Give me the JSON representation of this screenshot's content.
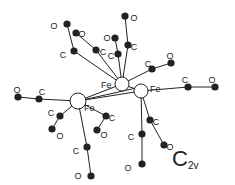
{
  "diagram": {
    "symmetry": {
      "main": "C",
      "subscript": "2v"
    },
    "colors": {
      "bond": "#222222",
      "atom_fill": "#222222",
      "fe_fill": "#ffffff",
      "background": "#ffffff"
    },
    "fe_atoms": [
      {
        "id": "fe1",
        "label": "Fe",
        "x": 78,
        "y": 101,
        "r": 8,
        "lx": 84,
        "ly": 108
      },
      {
        "id": "fe2",
        "label": "Fe",
        "x": 122,
        "y": 84,
        "r": 7,
        "lx": 101,
        "ly": 85
      },
      {
        "id": "fe3",
        "label": "Fe",
        "x": 141,
        "y": 91,
        "r": 7,
        "lx": 150,
        "ly": 89
      }
    ],
    "ligands": [
      {
        "fe": "fe2",
        "c": [
          74,
          51
        ],
        "o": [
          67,
          24
        ],
        "cl": [
          63,
          55
        ],
        "ol": [
          54,
          26
        ]
      },
      {
        "fe": "fe2",
        "c": [
          96,
          50
        ],
        "o": [
          76,
          33
        ],
        "cl": [
          103,
          52
        ],
        "ol": [
          82,
          34
        ]
      },
      {
        "fe": "fe2",
        "c": [
          128,
          45
        ],
        "o": [
          125,
          16
        ],
        "cl": [
          134,
          47
        ],
        "ol": [
          134,
          18
        ]
      },
      {
        "fe": "fe2",
        "c": [
          152,
          69
        ],
        "o": [
          171,
          63
        ],
        "cl": [
          148,
          64
        ],
        "ol": [
          170,
          56
        ]
      },
      {
        "fe": "fe3",
        "c": [
          188,
          87
        ],
        "o": [
          215,
          87
        ],
        "cl": [
          185,
          80
        ],
        "ol": [
          212,
          80
        ]
      },
      {
        "fe": "fe3",
        "c": [
          150,
          120
        ],
        "o": [
          164,
          145
        ],
        "cl": [
          156,
          122
        ],
        "ol": [
          170,
          147
        ]
      },
      {
        "fe": "fe3",
        "c": [
          142,
          134
        ],
        "o": [
          142,
          164
        ],
        "cl": [
          131,
          137
        ],
        "ol": [
          128,
          168
        ]
      },
      {
        "fe": "fe1",
        "c": [
          39,
          99
        ],
        "o": [
          18,
          97
        ],
        "cl": [
          42,
          92
        ],
        "ol": [
          17,
          90
        ]
      },
      {
        "fe": "fe1",
        "c": [
          60,
          116
        ],
        "o": [
          52,
          129
        ],
        "cl": [
          51,
          113
        ],
        "ol": [
          60,
          136
        ]
      },
      {
        "fe": "fe1",
        "c": [
          87,
          147
        ],
        "o": [
          91,
          176
        ],
        "cl": [
          76,
          151
        ],
        "ol": [
          78,
          176
        ]
      },
      {
        "fe": "fe1",
        "c": [
          106,
          116
        ],
        "o": [
          97,
          130
        ],
        "cl": [
          112,
          118
        ],
        "ol": [
          104,
          135
        ]
      },
      {
        "fe": "fe2",
        "c": [
          118,
          54
        ],
        "o": [
          115,
          38
        ],
        "cl": [
          111,
          56
        ],
        "ol": [
          107,
          38
        ]
      }
    ],
    "cc_labels": [
      {
        "text": "C",
        "x": 107,
        "y": 63
      }
    ]
  }
}
